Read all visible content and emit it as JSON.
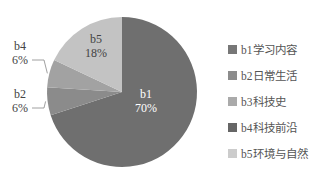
{
  "chart_data": {
    "type": "pie",
    "title": "",
    "categories": [
      "b1学习内容",
      "b2日常生活",
      "b3科技史",
      "b4科技前沿",
      "b5环境与自然"
    ],
    "slices": [
      {
        "key": "b1",
        "label": "b1",
        "value": 70,
        "pct_label": "70%",
        "color": "#6f6f6f"
      },
      {
        "key": "b2",
        "label": "b2",
        "value": 6,
        "pct_label": "6%",
        "color": "#8b8b8b"
      },
      {
        "key": "b4",
        "label": "b4",
        "value": 6,
        "pct_label": "6%",
        "color": "#a2a2a2"
      },
      {
        "key": "b5",
        "label": "b5",
        "value": 18,
        "pct_label": "18%",
        "color": "#c3c3c3"
      }
    ],
    "legend": [
      {
        "label": "b1学习内容",
        "color": "#777777"
      },
      {
        "label": "b2日常生活",
        "color": "#8c8c8c"
      },
      {
        "label": "b3科技史",
        "color": "#aaaaaa"
      },
      {
        "label": "b4科技前沿",
        "color": "#666666"
      },
      {
        "label": "b5环境与自然",
        "color": "#cccccc"
      }
    ],
    "legend_position": "right"
  }
}
